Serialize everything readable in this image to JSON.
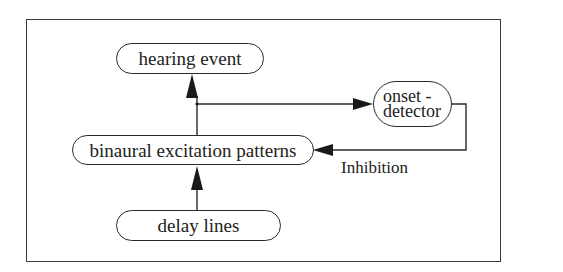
{
  "diagram": {
    "type": "flow",
    "nodes": {
      "hearing_event": {
        "label": "hearing event"
      },
      "binaural": {
        "label": "binaural excitation patterns"
      },
      "delay_lines": {
        "label": "delay lines"
      },
      "onset_detector": {
        "line1": "onset -",
        "line2": "detector"
      }
    },
    "edges": [
      {
        "from": "delay lines",
        "to": "binaural excitation patterns"
      },
      {
        "from": "binaural excitation patterns",
        "to": "hearing event"
      },
      {
        "from": "binaural excitation patterns",
        "to": "onset - detector"
      },
      {
        "from": "onset - detector",
        "to": "binaural excitation patterns",
        "label": "Inhibition"
      }
    ],
    "labels": {
      "inhibition": "Inhibition"
    },
    "colors": {
      "stroke": "#2a2a2a",
      "text": "#222222",
      "background": "#ffffff"
    }
  }
}
